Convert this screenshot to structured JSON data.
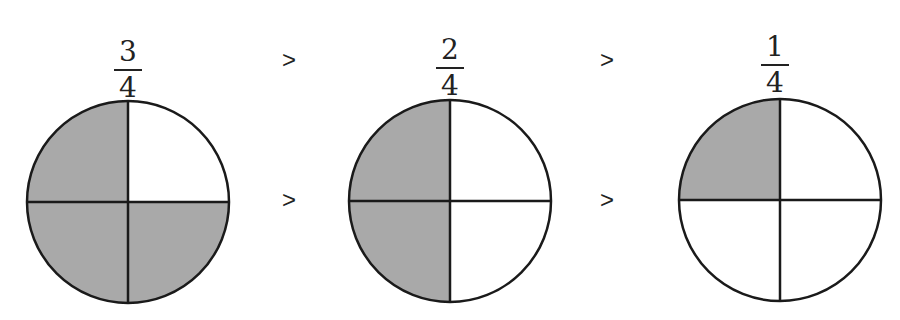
{
  "fractions": [
    {
      "numerator": "3",
      "denominator": "4",
      "shaded_quarters": [
        "top-left",
        "bottom-left",
        "bottom-right"
      ]
    },
    {
      "numerator": "2",
      "denominator": "4",
      "shaded_quarters": [
        "top-left",
        "bottom-left"
      ]
    },
    {
      "numerator": "1",
      "denominator": "4",
      "shaded_quarters": [
        "top-left"
      ]
    }
  ],
  "comparison_symbols": {
    "top_1": ">",
    "top_2": ">",
    "middle_1": ">",
    "middle_2": ">"
  },
  "colors": {
    "shade": "#a9a9a9",
    "stroke": "#1a1a1a",
    "background": "#ffffff"
  }
}
